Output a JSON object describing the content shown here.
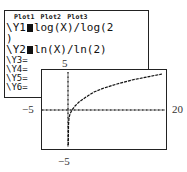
{
  "y_editor": {
    "plots": [
      "Plot1",
      "Plot2",
      "Plot3"
    ],
    "entries": [
      {
        "name": "Y1",
        "expr": "log(X)/log(2",
        "wrap": ")",
        "selected": true
      },
      {
        "name": "Y2",
        "expr": "ln(X)/ln(2)",
        "selected": true
      },
      {
        "name": "Y3",
        "expr": "="
      },
      {
        "name": "Y4",
        "expr": "="
      },
      {
        "name": "Y5",
        "expr": "="
      },
      {
        "name": "Y6",
        "expr": "="
      }
    ]
  },
  "graph": {
    "xmin_label": "−5",
    "xmax_label": "20",
    "ymax_label": "5",
    "ymin_label": "−5",
    "function": "log2(x)"
  }
}
